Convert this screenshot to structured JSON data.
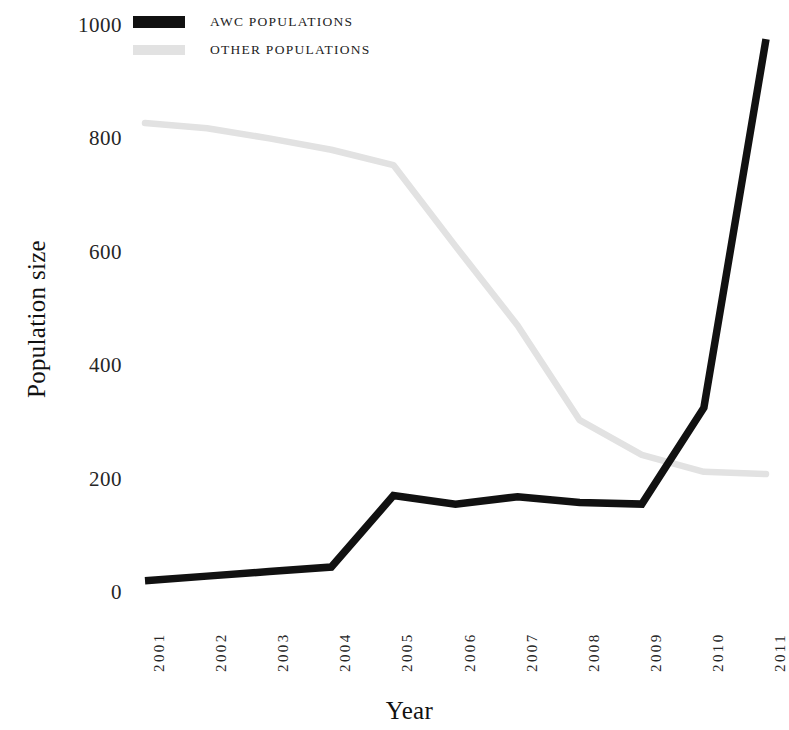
{
  "chart_data": {
    "type": "line",
    "title": "",
    "xlabel": "Year",
    "ylabel": "Population size",
    "categories": [
      "2001",
      "2002",
      "2003",
      "2004",
      "2005",
      "2006",
      "2007",
      "2008",
      "2009",
      "2010",
      "2011"
    ],
    "x": [
      2001,
      2002,
      2003,
      2004,
      2005,
      2006,
      2007,
      2008,
      2009,
      2010,
      2011
    ],
    "series": [
      {
        "name": "AWC POPULATIONS",
        "color": "#111111",
        "values": [
          20,
          28,
          36,
          44,
          170,
          155,
          168,
          158,
          155,
          325,
          975
        ]
      },
      {
        "name": "OTHER POPULATIONS",
        "color": "#e2e2e2",
        "values": [
          827,
          818,
          800,
          780,
          753,
          610,
          470,
          303,
          242,
          212,
          208
        ]
      }
    ],
    "ylim": [
      0,
      1000
    ],
    "yticks": [
      0,
      200,
      400,
      600,
      800,
      1000
    ],
    "ytick_labels": [
      "0",
      "200",
      "400",
      "600",
      "800",
      "1000"
    ],
    "xlim": [
      2001,
      2011
    ],
    "grid": false,
    "legend_position": "top-left",
    "axes_visible": false
  },
  "legend": {
    "items": [
      {
        "label": "AWC POPULATIONS",
        "color": "#111111",
        "swatch": "awc"
      },
      {
        "label": "OTHER POPULATIONS",
        "color": "#e2e2e2",
        "swatch": "other"
      }
    ]
  },
  "axes": {
    "y_title": "Population size",
    "x_title": "Year"
  }
}
